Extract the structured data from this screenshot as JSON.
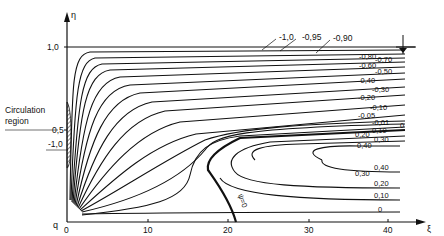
{
  "diagram": {
    "type": "contour-streamlines",
    "axes": {
      "y_symbol": "η",
      "x_symbol": "ξ",
      "origin_label": "q",
      "y_ticks": [
        "1,0",
        "0,5"
      ],
      "x_ticks": [
        "0",
        "10",
        "20",
        "30",
        "40"
      ]
    },
    "annotations": {
      "circulation_label_line1": "Circulation",
      "circulation_label_line2": "region",
      "circulation_value": "-1,0",
      "zero_stream_label": "ψ=0",
      "water_surface_symbol": "free-surface-marker"
    },
    "top_labels": [
      "-1,0",
      "-0,95",
      "-0,90"
    ],
    "right_labels": [
      "-0,80",
      "-0,70",
      "-0,60",
      "-0,50",
      "-0,40",
      "-0,30",
      "-0,20",
      "-0,10",
      "-0,05",
      "-0,01",
      "0",
      "0,10",
      "0,20",
      "0,30",
      "0,40",
      "0,40",
      "0,30",
      "0,20",
      "0,10",
      "0"
    ],
    "labels": {
      "m080": "-0,80",
      "m070": "-0,70",
      "m060": "-0,60",
      "m050": "-0,50",
      "m040": "-0,40",
      "m030": "-0,30",
      "m020": "-0,20",
      "m010": "-0,10",
      "m005": "-0,05",
      "m001": "-0,01",
      "zero": "0",
      "p010": "0,10",
      "p020": "0,20",
      "p030": "0,30",
      "p040": "0,40",
      "p040b": "0,40",
      "p030b": "0,30",
      "p020b": "0,20",
      "p010b": "0,10",
      "zerob": "0"
    }
  }
}
